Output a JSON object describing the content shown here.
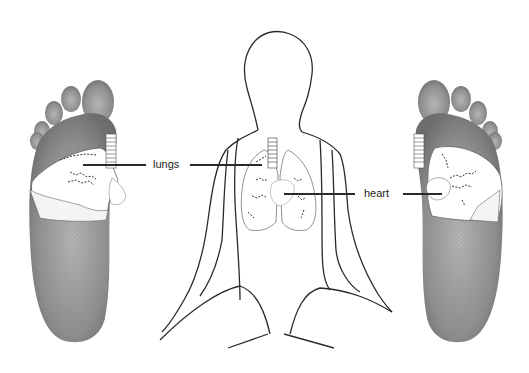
{
  "title": "",
  "labels": {
    "lungs": "lungs",
    "heart": "heart"
  },
  "figures": {
    "left_foot": "left foot sole with lung reflex zone",
    "body": "seated human outline with lungs and heart",
    "right_foot": "right foot sole with lung and heart reflex zones"
  },
  "colors": {
    "foot_shade": "#8a8a8a",
    "outline": "#2a2a2a",
    "zone_fill": "#ffffff",
    "background": "#ffffff"
  }
}
